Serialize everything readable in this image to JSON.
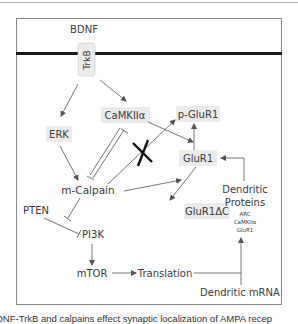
{
  "diagram": {
    "ligand": "BDNF",
    "receptor": "TrkB",
    "nodes": {
      "erk": "ERK",
      "camkii": "CaMKIIα",
      "pglur1": "p-GluR1",
      "glur1": "GluR1",
      "mcalpain": "m-Calpain",
      "glur1dc": "GluR1ΔC",
      "pten": "PTEN",
      "pi3k": "PI3K",
      "mtor": "mTOR",
      "translation": "Translation",
      "dendritic_mrna": "Dendritic mRNA",
      "dendritic_proteins_title_1": "Dendritic",
      "dendritic_proteins_title_2": "Proteins",
      "dendritic_proteins_items": [
        "ARC",
        "CaMKIIα",
        "GluR1"
      ]
    },
    "colors": {
      "box_fill": "#ebebeb",
      "text": "#3a3a3a",
      "arrow": "#555555",
      "membrane": "#1a1a1a",
      "block_x": "#111111"
    }
  },
  "caption": "DNF-TrkB and calpains effect synaptic localization of AMPA recep"
}
